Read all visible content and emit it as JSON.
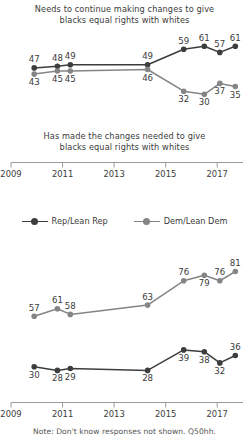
{
  "colors": {
    "rep": "#3d3d3d",
    "dem": "#858585",
    "axis": "#9a9a9a",
    "text": "#3b3b3b",
    "note": "#555555",
    "background": "#ffffff"
  },
  "legend": {
    "items": [
      {
        "name": "Rep/Lean Rep",
        "color_key": "rep"
      },
      {
        "name": "Dem/Lean Dem",
        "color_key": "dem"
      }
    ]
  },
  "note": "Note: Don't know responses not shown. Q50hh.",
  "axis": {
    "ticks": [
      "2009",
      "2011",
      "2013",
      "2015",
      "2017"
    ],
    "tick_years": [
      2009,
      2011,
      2013,
      2015,
      2017
    ],
    "range": [
      2009,
      2018
    ]
  },
  "chart_data": [
    {
      "id": "needs-to-continue",
      "type": "line",
      "title": "Needs to continue making changes to give blacks equal rights with whites",
      "title_line1": "Needs to continue making changes to give",
      "title_line2": "blacks equal rights with whites",
      "xlabel": "",
      "ylabel": "",
      "x": [
        2009.9,
        2010.8,
        2011.3,
        2014.3,
        2015.7,
        2016.5,
        2017.1,
        2017.7
      ],
      "xtick_labels": [
        "2009",
        "2011",
        "2013",
        "2015",
        "2017"
      ],
      "ylim": [
        25,
        65
      ],
      "grid": false,
      "legend_position": "below-chart",
      "series": [
        {
          "name": "Rep/Lean Rep",
          "color_key": "rep",
          "values": [
            47,
            48,
            49,
            49,
            59,
            61,
            57,
            61
          ],
          "label_positions": [
            "above",
            "above",
            "above",
            "above",
            "above",
            "above",
            "above",
            "above"
          ]
        },
        {
          "name": "Dem/Lean Dem",
          "color_key": "dem",
          "values": [
            43,
            45,
            45,
            46,
            32,
            30,
            37,
            35
          ],
          "label_positions": [
            "below",
            "below",
            "below",
            "below",
            "below",
            "below",
            "below",
            "below"
          ]
        }
      ]
    },
    {
      "id": "has-made-the-changes",
      "type": "line",
      "title": "Has made the changes needed to give blacks equal rights with whites",
      "title_line1": "Has made the changes needed to give",
      "title_line2": "blacks equal rights with whites",
      "xlabel": "",
      "ylabel": "",
      "x": [
        2009.9,
        2010.8,
        2011.3,
        2014.3,
        2015.7,
        2016.5,
        2017.1,
        2017.7
      ],
      "xtick_labels": [
        "2009",
        "2011",
        "2013",
        "2015",
        "2017"
      ],
      "ylim": [
        25,
        85
      ],
      "grid": false,
      "legend_position": "above-chart",
      "series": [
        {
          "name": "Dem/Lean Dem",
          "color_key": "dem",
          "values": [
            57,
            61,
            58,
            63,
            76,
            79,
            76,
            81
          ],
          "label_positions": [
            "above",
            "above",
            "above",
            "above",
            "above",
            "below",
            "above",
            "above"
          ]
        },
        {
          "name": "Rep/Lean Rep",
          "color_key": "rep",
          "values": [
            30,
            28,
            29,
            28,
            39,
            38,
            32,
            36
          ],
          "label_positions": [
            "below",
            "below",
            "below",
            "below",
            "below",
            "below",
            "below",
            "above"
          ]
        }
      ]
    }
  ]
}
